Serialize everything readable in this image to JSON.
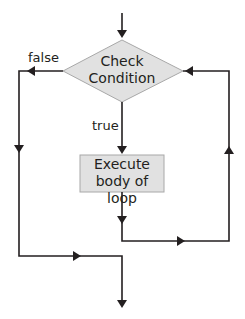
{
  "diagram": {
    "type": "flowchart",
    "title": "",
    "colors": {
      "line": "#231f20",
      "node_fill": "#e1e1e1",
      "node_stroke": "#a8a8a8",
      "background": "#ffffff"
    },
    "nodes": {
      "condition": {
        "shape": "diamond",
        "line1": "Check",
        "line2": "Condition"
      },
      "body": {
        "shape": "rectangle",
        "line1": "Execute",
        "line2": "body of loop"
      }
    },
    "edge_labels": {
      "false": "false",
      "true": "true"
    },
    "edges": [
      {
        "from": "entry",
        "to": "condition"
      },
      {
        "from": "condition",
        "to": "body",
        "label": "true"
      },
      {
        "from": "condition",
        "to": "exit",
        "label": "false"
      },
      {
        "from": "body",
        "to": "condition",
        "label": ""
      }
    ]
  }
}
